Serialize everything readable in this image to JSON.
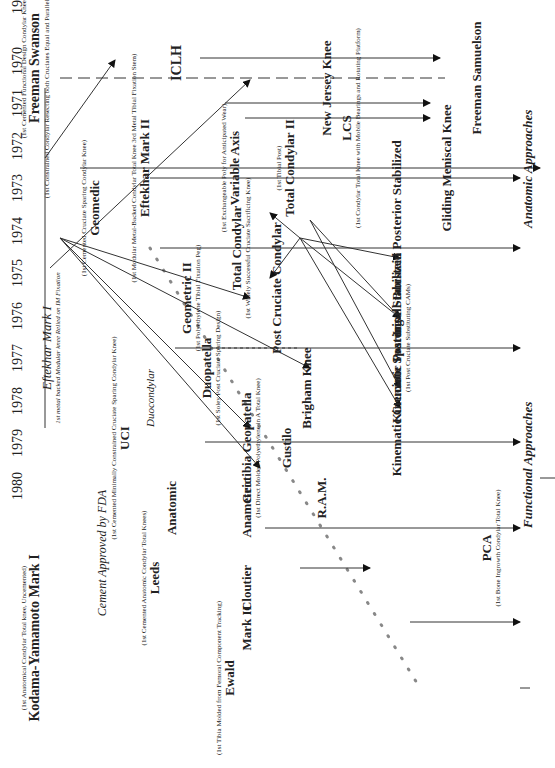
{
  "years": [
    "1970",
    "1971",
    "1972",
    "1973",
    "1974",
    "1975",
    "1976",
    "1977",
    "1978",
    "1979",
    "1980"
  ],
  "axis_labels": {
    "functional": "Functional Approaches",
    "anatomic": "Anatomic Approaches"
  },
  "annotations": {
    "cement": "Cement Approved by FDA"
  },
  "designs": {
    "kodama": {
      "note": "(1st Anatomical Condylar Total knee, Uncemented)",
      "name": "Kodama-Yamamoto Mark I"
    },
    "freeman_swanson": {
      "note_top": "(1st Cemented Functional Design Condylar Knee)",
      "name": "Freeman Swanson",
      "note": "(1st Constrained Condylar Resecting both Cruciates Equal and Parallel Flex and Ext. spaces)"
    },
    "eftekhar1": {
      "name": "Eftekhar Mark I",
      "note": "1st metal backed Modular knee Relied on IM Fixation"
    },
    "geomedic": {
      "note": "(1st Cemented Cruciate Sparing Condylar Knee)",
      "name": "Geomedic"
    },
    "uci": {
      "note": "(1st Cemented Minimally Constrained Cruciate Sparing Condylar Knee)",
      "name": "UCI"
    },
    "duocondylar": {
      "name": "Duocondylar"
    },
    "leeds": {
      "note": "(1st Cemented Anatomic Condylar Total Knees)",
      "name": "Leeds"
    },
    "anatomic": {
      "name": "Anatomic"
    },
    "eftekhar2": {
      "note": "(1st Modular Metal-Backed Condylar Total Knee 3rd Metal Tibial Fixation Stem)",
      "name": "Eftekhar Mark II"
    },
    "iclh": {
      "name": "ICLH"
    },
    "variable_axis": {
      "note": "(1st Exchangeable Poly for Anticipated Wear)",
      "name": "Variable Axis"
    },
    "geometric2": {
      "name": "Geometric II",
      "note": "(1st Polyethylene Tibial Fixation Peg)"
    },
    "duopatella": {
      "name": "Duopatella",
      "note": "(1st Soley Post Cruciate Sparing Design)"
    },
    "total_condylar": {
      "name": "Total Condylar",
      "note": "(1st Widely Successful Cruciate Sacrificing Knee)"
    },
    "geotibia": {
      "name": "Geotibia Geopatella",
      "note": "(1st Direct Molded Polyethylene in A Total Knee)"
    },
    "anametric": {
      "name": "Anametric"
    },
    "cloutier": {
      "name": "Cloutier"
    },
    "mark2": {
      "name": "Mark II"
    },
    "ewald": {
      "note": "(1st Tibia Molded from Femoral Component Tracking)",
      "name": "Ewald"
    },
    "post_cruciate_condylar": {
      "name": "Post Cruciate Condylar"
    },
    "total_condylar2": {
      "note": "(1st Tibial Post)",
      "name": "Total Condylar II"
    },
    "new_jersey": {
      "name": "New Jersey Knee"
    },
    "lcs": {
      "name": "LCS",
      "note": "(1st Condylar Total Knee with Mobile Bearings and Rotating Platform)"
    },
    "brigham": {
      "name": "Brigham Knee"
    },
    "gustilo": {
      "name": "Gustilo"
    },
    "ram": {
      "name": "R.A.M."
    },
    "kin_cruciate": {
      "name": "Kinematic Cruciate Sparing"
    },
    "kin_ps": {
      "name": "Kinematic Posterior Stabilized",
      "note": "(1st Post Cruciate Substituting CAMs)"
    },
    "ib_ps": {
      "name": "Insall-Burstein Posterior Stabilized"
    },
    "gliding": {
      "name": "Gliding Meniscal Knee"
    },
    "freeman_samuelson": {
      "name": "Freeman Samuelson"
    },
    "pca": {
      "name": "PCA",
      "note": "(1st Bone Ingrowth Condylar Total Knee)"
    }
  },
  "colors": {
    "line": "#333333",
    "ink": "#222222",
    "dots": "#888888",
    "background": "#ffffff"
  }
}
